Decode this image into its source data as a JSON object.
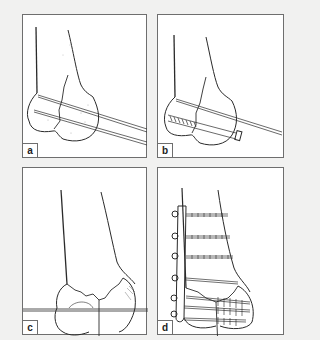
{
  "figure": {
    "panels": [
      {
        "id": "a",
        "label": "a",
        "description": "Distal femur fracture reduced and held with two parallel Kirschner wires"
      },
      {
        "id": "b",
        "label": "b",
        "description": "Lag screw inserted across condyles, one K-wire retained"
      },
      {
        "id": "c",
        "label": "c",
        "description": "Comminuted supracondylar fracture with transcondylar guide wire"
      },
      {
        "id": "d",
        "label": "d",
        "description": "Lateral plate fixation with multiple screws"
      }
    ],
    "colors": {
      "background": "#f1f1f0",
      "panel_bg": "#ffffff",
      "border": "#6e6e6e",
      "ink": "#2a2a2a"
    }
  }
}
